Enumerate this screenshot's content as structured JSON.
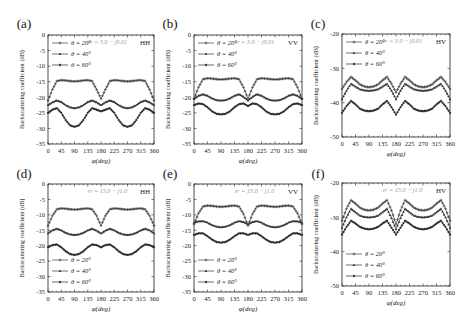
{
  "chart_data": [
    {
      "type": "line",
      "panel_label": "(a)",
      "polarization": "HH",
      "annotation": "εr = 3.0 − j0.01",
      "xlabel": "φ(deg)",
      "ylabel": "Backscattering coefficient (dB)",
      "xlim": [
        0,
        360
      ],
      "ylim": [
        -35,
        0
      ],
      "xticks": [
        0,
        45,
        90,
        135,
        180,
        225,
        270,
        315,
        360
      ],
      "yticks": [
        0,
        -5,
        -10,
        -15,
        -20,
        -25,
        -30,
        -35
      ],
      "legend_position": "top-left",
      "x": [
        0,
        15,
        30,
        45,
        60,
        75,
        90,
        105,
        120,
        135,
        150,
        165,
        180,
        195,
        210,
        225,
        240,
        255,
        270,
        285,
        300,
        315,
        330,
        345,
        360
      ],
      "series": [
        {
          "name": "θ = 20°",
          "marker": "plus",
          "values": [
            -21,
            -17.5,
            -14.8,
            -14.5,
            -14.6,
            -14.8,
            -14.9,
            -14.8,
            -14.6,
            -14.5,
            -14.8,
            -17.5,
            -20.5,
            -17.5,
            -14.8,
            -14.5,
            -14.6,
            -14.8,
            -14.9,
            -14.8,
            -14.6,
            -14.5,
            -14.8,
            -17.5,
            -21
          ]
        },
        {
          "name": "θ = 40°",
          "marker": "triangle",
          "values": [
            -22.5,
            -21.6,
            -21,
            -21.5,
            -22.5,
            -23.2,
            -23.5,
            -23.2,
            -22.5,
            -21.5,
            -21,
            -21.6,
            -22.5,
            -21.6,
            -21,
            -21.5,
            -22.5,
            -23.2,
            -23.5,
            -23.2,
            -22.5,
            -21.5,
            -21,
            -21.6,
            -22.5
          ]
        },
        {
          "name": "θ = 60°",
          "marker": "diamond",
          "values": [
            -25,
            -24,
            -23.5,
            -25,
            -27.3,
            -29,
            -29.5,
            -29,
            -27.3,
            -25,
            -23.5,
            -24,
            -24.5,
            -24,
            -23.5,
            -25,
            -27.3,
            -29,
            -29.5,
            -29,
            -27.3,
            -25,
            -23.5,
            -24,
            -25
          ]
        }
      ]
    },
    {
      "type": "line",
      "panel_label": "(b)",
      "polarization": "VV",
      "annotation": "εr = 3.0 − j0.01",
      "xlabel": "φ(deg)",
      "ylabel": "Backscattering coefficient (dB)",
      "xlim": [
        0,
        360
      ],
      "ylim": [
        -35,
        0
      ],
      "xticks": [
        0,
        45,
        90,
        135,
        180,
        225,
        270,
        315,
        360
      ],
      "yticks": [
        0,
        -5,
        -10,
        -15,
        -20,
        -25,
        -30,
        -35
      ],
      "legend_position": "top-left",
      "x": [
        0,
        15,
        30,
        45,
        60,
        75,
        90,
        105,
        120,
        135,
        150,
        165,
        180,
        195,
        210,
        225,
        240,
        255,
        270,
        285,
        300,
        315,
        330,
        345,
        360
      ],
      "series": [
        {
          "name": "θ = 20°",
          "marker": "plus",
          "values": [
            -20.5,
            -16.8,
            -14.2,
            -13.9,
            -14,
            -14.2,
            -14.3,
            -14.2,
            -14,
            -13.9,
            -14.2,
            -16.8,
            -20.5,
            -16.8,
            -14.2,
            -13.9,
            -14,
            -14.2,
            -14.3,
            -14.2,
            -14,
            -13.9,
            -14.2,
            -16.8,
            -20.5
          ]
        },
        {
          "name": "θ = 40°",
          "marker": "triangle",
          "values": [
            -20.5,
            -19.5,
            -19,
            -19.5,
            -20.3,
            -20.9,
            -21,
            -20.9,
            -20.3,
            -19.5,
            -19,
            -19.8,
            -21,
            -19.8,
            -19,
            -19.5,
            -20.3,
            -20.9,
            -21,
            -20.9,
            -20.3,
            -19.5,
            -19,
            -19.5,
            -20.5
          ]
        },
        {
          "name": "θ = 60°",
          "marker": "diamond",
          "values": [
            -22.5,
            -22,
            -22.2,
            -23.2,
            -24.5,
            -25.3,
            -25.5,
            -25.3,
            -24.5,
            -23.2,
            -22.2,
            -22,
            -22.8,
            -22,
            -22.2,
            -23.2,
            -24.5,
            -25.3,
            -25.5,
            -25.3,
            -24.5,
            -23.2,
            -22.2,
            -22,
            -22.5
          ]
        }
      ]
    },
    {
      "type": "line",
      "panel_label": "(c)",
      "polarization": "HV",
      "annotation": "εr = 3.0 − j0.01",
      "xlabel": "φ(deg)",
      "ylabel": "Backscattering coefficient (dB)",
      "xlim": [
        0,
        360
      ],
      "ylim": [
        -50,
        -20
      ],
      "xticks": [
        0,
        45,
        90,
        135,
        180,
        225,
        270,
        315,
        360
      ],
      "yticks": [
        -20,
        -30,
        -40,
        -50
      ],
      "legend_position": "top-left",
      "x": [
        0,
        15,
        30,
        45,
        60,
        75,
        90,
        105,
        120,
        135,
        150,
        165,
        180,
        195,
        210,
        225,
        240,
        255,
        270,
        285,
        300,
        315,
        330,
        345,
        360
      ],
      "series": [
        {
          "name": "θ = 20°",
          "marker": "plus",
          "values": [
            -36,
            -34,
            -32.5,
            -33.5,
            -34.7,
            -35.3,
            -35.5,
            -35.3,
            -34.7,
            -33.5,
            -32.5,
            -34.5,
            -37,
            -34.5,
            -32.5,
            -33.5,
            -34.7,
            -35.3,
            -35.5,
            -35.3,
            -34.7,
            -33.5,
            -32.5,
            -34,
            -36
          ]
        },
        {
          "name": "θ = 40°",
          "marker": "triangle",
          "values": [
            -39,
            -36.5,
            -34.5,
            -35.3,
            -36.1,
            -36.4,
            -36.5,
            -36.4,
            -36.1,
            -35.3,
            -34.5,
            -36.5,
            -39,
            -36.5,
            -34.5,
            -35.3,
            -36.1,
            -36.4,
            -36.5,
            -36.4,
            -36.1,
            -35.3,
            -34.5,
            -36.5,
            -39
          ]
        },
        {
          "name": "θ = 60°",
          "marker": "diamond",
          "values": [
            -43,
            -41,
            -39.5,
            -40.5,
            -41.8,
            -42.3,
            -42.5,
            -42.3,
            -41.8,
            -40.5,
            -39.5,
            -41.3,
            -43.5,
            -41.3,
            -39.5,
            -40.5,
            -41.8,
            -42.3,
            -42.5,
            -42.3,
            -41.8,
            -40.5,
            -39.5,
            -41,
            -43
          ]
        }
      ]
    },
    {
      "type": "line",
      "panel_label": "(d)",
      "polarization": "HH",
      "annotation": "εr = 15.0 − j1.0",
      "xlabel": "φ(deg)",
      "ylabel": "Backscattering coefficient (dB)",
      "xlim": [
        0,
        360
      ],
      "ylim": [
        -35,
        0
      ],
      "xticks": [
        0,
        45,
        90,
        135,
        180,
        225,
        270,
        315,
        360
      ],
      "yticks": [
        0,
        -5,
        -10,
        -15,
        -20,
        -25,
        -30,
        -35
      ],
      "legend_position": "bottom-left",
      "x": [
        0,
        15,
        30,
        45,
        60,
        75,
        90,
        105,
        120,
        135,
        150,
        165,
        180,
        195,
        210,
        225,
        240,
        255,
        270,
        285,
        300,
        315,
        330,
        345,
        360
      ],
      "series": [
        {
          "name": "θ = 20°",
          "marker": "plus",
          "values": [
            -13.5,
            -10.3,
            -8.2,
            -7.9,
            -8,
            -8.2,
            -8.3,
            -8.2,
            -8,
            -7.9,
            -8.2,
            -10.3,
            -13.5,
            -10.3,
            -8.2,
            -7.9,
            -8,
            -8.2,
            -8.3,
            -8.2,
            -8,
            -7.9,
            -8.2,
            -10.3,
            -13.5
          ]
        },
        {
          "name": "θ = 40°",
          "marker": "triangle",
          "values": [
            -16,
            -15,
            -14.5,
            -15,
            -15.8,
            -16.3,
            -16.5,
            -16.3,
            -15.8,
            -15,
            -14.5,
            -15.1,
            -16,
            -15.1,
            -14.5,
            -15,
            -15.8,
            -16.3,
            -16.5,
            -16.3,
            -15.8,
            -15,
            -14.5,
            -15,
            -16
          ]
        },
        {
          "name": "θ = 60°",
          "marker": "diamond",
          "values": [
            -20.5,
            -19.8,
            -19.6,
            -20.5,
            -21.8,
            -22.7,
            -23,
            -22.7,
            -21.8,
            -20.5,
            -19.6,
            -19.8,
            -20.5,
            -19.8,
            -19.6,
            -20.5,
            -21.8,
            -22.7,
            -23,
            -22.7,
            -21.8,
            -20.5,
            -19.6,
            -19.8,
            -20.5
          ]
        }
      ]
    },
    {
      "type": "line",
      "panel_label": "(e)",
      "polarization": "VV",
      "annotation": "εr = 15.0 − j1.0",
      "xlabel": "φ(deg)",
      "ylabel": "Backscattering coefficient (dB)",
      "xlim": [
        0,
        360
      ],
      "ylim": [
        -35,
        0
      ],
      "xticks": [
        0,
        45,
        90,
        135,
        180,
        225,
        270,
        315,
        360
      ],
      "yticks": [
        0,
        -5,
        -10,
        -15,
        -20,
        -25,
        -30,
        -35
      ],
      "legend_position": "bottom-left",
      "x": [
        0,
        15,
        30,
        45,
        60,
        75,
        90,
        105,
        120,
        135,
        150,
        165,
        180,
        195,
        210,
        225,
        240,
        255,
        270,
        285,
        300,
        315,
        330,
        345,
        360
      ],
      "series": [
        {
          "name": "θ = 20°",
          "marker": "plus",
          "values": [
            -13,
            -9.5,
            -7.3,
            -7,
            -7.1,
            -7.3,
            -7.4,
            -7.3,
            -7.1,
            -7,
            -7.3,
            -9.7,
            -13.5,
            -9.7,
            -7.3,
            -7,
            -7.1,
            -7.3,
            -7.4,
            -7.3,
            -7.1,
            -7,
            -7.3,
            -9.5,
            -13
          ]
        },
        {
          "name": "θ = 40°",
          "marker": "triangle",
          "values": [
            -12.5,
            -12.1,
            -12,
            -12.5,
            -13.3,
            -13.8,
            -14,
            -13.8,
            -13.3,
            -12.5,
            -12,
            -12.3,
            -13,
            -12.3,
            -12,
            -12.5,
            -13.3,
            -13.8,
            -14,
            -13.8,
            -13.3,
            -12.5,
            -12,
            -12.1,
            -12.5
          ]
        },
        {
          "name": "θ = 60°",
          "marker": "diamond",
          "values": [
            -16.5,
            -16,
            -16,
            -16.9,
            -18,
            -18.8,
            -19,
            -18.8,
            -18,
            -16.9,
            -16,
            -16,
            -16.5,
            -16,
            -16,
            -16.9,
            -18,
            -18.8,
            -19,
            -18.8,
            -18,
            -16.9,
            -16,
            -16,
            -16.5
          ]
        }
      ]
    },
    {
      "type": "line",
      "panel_label": "(f)",
      "polarization": "HV",
      "annotation": "εr = 15.0 − j1.0",
      "xlabel": "φ(deg)",
      "ylabel": "Backscattering coefficient (dB)",
      "xlim": [
        0,
        360
      ],
      "ylim": [
        -50,
        -20
      ],
      "xticks": [
        0,
        45,
        90,
        135,
        180,
        225,
        270,
        315,
        360
      ],
      "yticks": [
        -20,
        -30,
        -40,
        -50
      ],
      "legend_position": "bottom-left",
      "x": [
        0,
        15,
        30,
        45,
        60,
        75,
        90,
        105,
        120,
        135,
        150,
        165,
        180,
        195,
        210,
        225,
        240,
        255,
        270,
        285,
        300,
        315,
        330,
        345,
        360
      ],
      "series": [
        {
          "name": "θ = 20°",
          "marker": "plus",
          "values": [
            -31,
            -27.5,
            -25,
            -26,
            -27.2,
            -27.8,
            -28,
            -27.8,
            -27.2,
            -26,
            -25,
            -28,
            -32,
            -28,
            -25,
            -26,
            -27.2,
            -27.8,
            -28,
            -27.8,
            -27.2,
            -26,
            -25,
            -27.5,
            -31
          ]
        },
        {
          "name": "θ = 40°",
          "marker": "triangle",
          "values": [
            -33,
            -30,
            -27.5,
            -28.5,
            -29.5,
            -29.9,
            -30,
            -29.9,
            -29.5,
            -28.5,
            -27.5,
            -30.2,
            -33.5,
            -30.2,
            -27.5,
            -28.5,
            -29.5,
            -29.9,
            -30,
            -29.9,
            -29.5,
            -28.5,
            -27.5,
            -30,
            -33
          ]
        },
        {
          "name": "θ = 60°",
          "marker": "diamond",
          "values": [
            -35,
            -32.8,
            -31,
            -31.8,
            -32.8,
            -33.3,
            -33.5,
            -33.3,
            -32.8,
            -31.8,
            -31,
            -33,
            -35,
            -33,
            -31,
            -31.8,
            -32.8,
            -33.3,
            -33.5,
            -33.3,
            -32.8,
            -31.8,
            -31,
            -32.8,
            -35
          ]
        }
      ]
    }
  ],
  "colors": {
    "axis": "#222222",
    "series": [
      "#444444",
      "#333333",
      "#2a2a2a"
    ],
    "annotation": "#9a9a9a"
  }
}
